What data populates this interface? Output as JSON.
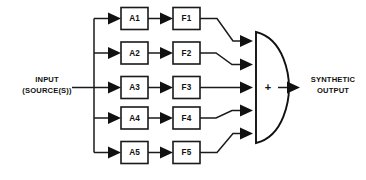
{
  "diagram": {
    "background_color": "#ffffff",
    "line_color": "#1a1a1a",
    "text_color": "#111111",
    "input": {
      "label_line1": "INPUT",
      "label_line2": "(SOURCE(S))",
      "icon": "input-arrow-icon"
    },
    "output": {
      "label_line1": "SYNTHETIC",
      "label_line2": "OUTPUT",
      "icon": "output-arrow-icon"
    },
    "summer": {
      "symbol": "+",
      "name": "summing-junction",
      "shape": "d-shape",
      "input_count": 5
    },
    "channels": [
      {
        "index": 1,
        "amplifier": "A1",
        "filter": "F1"
      },
      {
        "index": 2,
        "amplifier": "A2",
        "filter": "F2"
      },
      {
        "index": 3,
        "amplifier": "A3",
        "filter": "F3"
      },
      {
        "index": 4,
        "amplifier": "A4",
        "filter": "F4"
      },
      {
        "index": 5,
        "amplifier": "A5",
        "filter": "F5"
      }
    ]
  }
}
